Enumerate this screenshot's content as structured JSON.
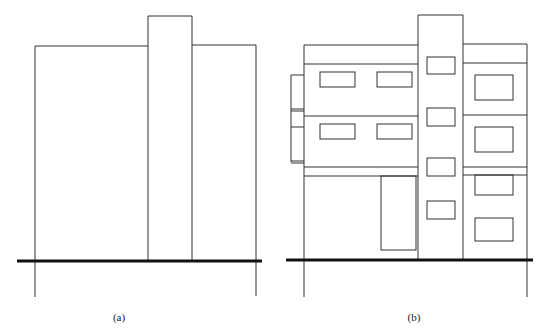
{
  "figure": {
    "panels": [
      {
        "id": "a",
        "caption": "(a)"
      },
      {
        "id": "b",
        "caption": "(b)"
      }
    ],
    "colors": {
      "line": "#333333",
      "ground": "#111111",
      "background": "#ffffff"
    }
  }
}
